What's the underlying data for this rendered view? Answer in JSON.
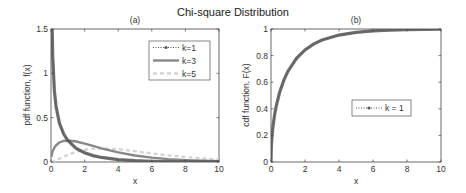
{
  "chart_data": [
    {
      "type": "line",
      "panel": "(a)",
      "title": "(a)",
      "xlabel": "x",
      "ylabel": "pdf function, f(x)",
      "xlim": [
        0,
        10
      ],
      "ylim": [
        0,
        1.5
      ],
      "xticks": [
        0,
        2,
        4,
        6,
        8,
        10
      ],
      "xtick_labels": [
        "0",
        "2",
        "4",
        "6",
        "8",
        "10"
      ],
      "yticks": [
        0,
        0.5,
        1,
        1.5
      ],
      "ytick_labels": [
        "0",
        "0.5",
        "1",
        "1.5"
      ],
      "grid": false,
      "legend_position": "top-right",
      "x": [
        0.02,
        0.05,
        0.1,
        0.2,
        0.3,
        0.5,
        0.75,
        1,
        1.5,
        2,
        2.5,
        3,
        4,
        5,
        6,
        7,
        8,
        9,
        10
      ],
      "series": [
        {
          "name": "k=1",
          "style": "dotted-marker",
          "color": "#555555",
          "values": [
            2.79,
            1.74,
            1.2,
            0.807,
            0.627,
            0.439,
            0.317,
            0.242,
            0.154,
            0.104,
            0.0723,
            0.0514,
            0.027,
            0.0146,
            0.0081,
            0.0046,
            0.0026,
            0.0015,
            0.00085
          ]
        },
        {
          "name": "k=3",
          "style": "solid",
          "color": "#888888",
          "values": [
            0.0559,
            0.087,
            0.12,
            0.161,
            0.188,
            0.22,
            0.237,
            0.242,
            0.231,
            0.208,
            0.181,
            0.154,
            0.108,
            0.0733,
            0.0487,
            0.0319,
            0.0207,
            0.0133,
            0.0085
          ]
        },
        {
          "name": "k=5",
          "style": "dashed",
          "color": "#d4d4d4",
          "values": [
            0.00037,
            0.00145,
            0.004,
            0.0108,
            0.0188,
            0.0366,
            0.0594,
            0.0807,
            0.1154,
            0.1384,
            0.1506,
            0.1542,
            0.144,
            0.122,
            0.0973,
            0.0744,
            0.0551,
            0.0399,
            0.0283
          ]
        }
      ]
    },
    {
      "type": "line",
      "panel": "(b)",
      "title": "(b)",
      "xlabel": "x",
      "ylabel": "cdf function, F(x)",
      "xlim": [
        0,
        10
      ],
      "ylim": [
        0,
        1
      ],
      "xticks": [
        0,
        2,
        4,
        6,
        8,
        10
      ],
      "xtick_labels": [
        "0",
        "2",
        "4",
        "6",
        "8",
        "10"
      ],
      "yticks": [
        0,
        0.2,
        0.4,
        0.6,
        0.8,
        1
      ],
      "ytick_labels": [
        "0",
        "0.2",
        "0.4",
        "0.6",
        "0.8",
        "1"
      ],
      "grid": false,
      "legend_position": "center-right",
      "x": [
        0,
        0.02,
        0.05,
        0.1,
        0.2,
        0.3,
        0.5,
        0.75,
        1,
        1.5,
        2,
        2.5,
        3,
        4,
        5,
        6,
        7,
        8,
        9,
        10
      ],
      "series": [
        {
          "name": "k = 1",
          "style": "dotted-marker",
          "color": "#555555",
          "values": [
            0,
            0.1125,
            0.1769,
            0.2482,
            0.3453,
            0.4161,
            0.5205,
            0.6135,
            0.6827,
            0.7793,
            0.8427,
            0.8862,
            0.9167,
            0.9545,
            0.9747,
            0.9857,
            0.9918,
            0.9953,
            0.9973,
            0.9984
          ]
        }
      ]
    }
  ],
  "figure": {
    "title": "Chi-square Distribution"
  }
}
